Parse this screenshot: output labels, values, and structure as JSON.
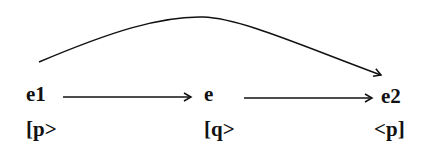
{
  "diagram": {
    "nodes": [
      {
        "id": "e1",
        "label": "e1",
        "annotation": "[p>"
      },
      {
        "id": "e",
        "label": "e",
        "annotation": "[q>"
      },
      {
        "id": "e2",
        "label": "e2",
        "annotation": "<p]"
      }
    ],
    "edges": [
      {
        "from": "e1",
        "to": "e",
        "style": "straight"
      },
      {
        "from": "e",
        "to": "e2",
        "style": "straight"
      },
      {
        "from": "e1",
        "to": "e2",
        "style": "curved-over"
      }
    ],
    "colors": {
      "ink": "#111111",
      "background": "#ffffff"
    }
  }
}
